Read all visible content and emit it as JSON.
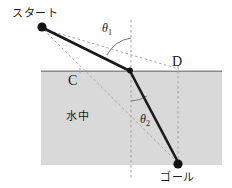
{
  "figure": {
    "canvas": {
      "width": 232,
      "height": 188,
      "background": "#ffffff"
    },
    "labels": {
      "start": "スタート",
      "goal": "ゴール",
      "water": "水中",
      "point_c": "C",
      "point_d": "D",
      "theta1": "θ",
      "theta1_sub": "1",
      "theta2": "θ",
      "theta2_sub": "2"
    },
    "colors": {
      "water_fill": "#d9d9d9",
      "surface_line": "#808080",
      "solid_path": "#1a1a1a",
      "dashed_path": "#9a9a9a",
      "dot": "#111111",
      "text": "#1a1a1a"
    },
    "geometry": {
      "water_region": {
        "x": 41,
        "y": 71,
        "width": 181,
        "height": 94
      },
      "surface_y": 71,
      "start_point": {
        "x": 42,
        "y": 27
      },
      "refraction_point": {
        "x": 130,
        "y": 71
      },
      "goal_point": {
        "x": 178,
        "y": 163
      },
      "point_c": {
        "x": 80,
        "y": 71
      },
      "point_d": {
        "x": 178,
        "y": 71
      },
      "vertical_normal_x": 131,
      "vertical_goal_x": 178,
      "normal_top_y": 20,
      "normal_bottom_y": 178,
      "theta1_arc_radius": 33,
      "theta2_arc_radius": 30
    }
  }
}
